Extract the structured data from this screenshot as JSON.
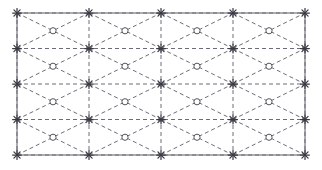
{
  "figure": {
    "title": "",
    "type": "mesh-grid-diagram",
    "background_color": "#ffffff",
    "width": 322,
    "height": 170
  },
  "domain_rect": {
    "x_min": 17,
    "x_max": 305,
    "y_min": 13,
    "y_max": 155,
    "stroke": "#6a6a72",
    "stroke_width": 1.1,
    "fill": "none",
    "label": "domain-boundary"
  },
  "grid": {
    "columns": 4,
    "rows": 4,
    "cell_width": 72,
    "cell_height": 35.5,
    "x_lines": [
      17,
      89,
      161,
      233,
      305
    ],
    "y_lines": [
      13,
      48.5,
      84,
      119.5,
      155
    ],
    "line_color": "#5b5b66",
    "line_style": "dashed",
    "dash_pattern": "4,3",
    "stroke_width": 0.9
  },
  "diagonals": {
    "description": "Each rectangular cell is crossed by two diagonals forming an X, producing a diamond/triangle mesh",
    "line_color": "#5b5b66",
    "line_style": "dashed",
    "dash_pattern": "4,3",
    "stroke_width": 0.9
  },
  "cell_centers": {
    "marker": "circle",
    "marker_label": "cell-center-node",
    "radius": 3.1,
    "fill": "#ffffff",
    "stroke": "#55555f",
    "stroke_width": 1.0,
    "x_positions": [
      53,
      125,
      197,
      269
    ],
    "y_positions": [
      30.75,
      66.25,
      101.75,
      137.25
    ],
    "count": 16
  },
  "grid_nodes": {
    "marker": "star",
    "marker_label": "grid-intersection-node",
    "size": 4.4,
    "color": "#3a3a44",
    "x_positions": [
      17,
      89,
      161,
      233,
      305
    ],
    "y_positions": [
      13,
      48.5,
      84,
      119.5,
      155
    ],
    "count": 25
  },
  "legend": {
    "visible": false,
    "entries": []
  },
  "axes": {
    "visible": false,
    "x_ticks": [],
    "y_ticks": [],
    "xlabel": "",
    "ylabel": ""
  }
}
